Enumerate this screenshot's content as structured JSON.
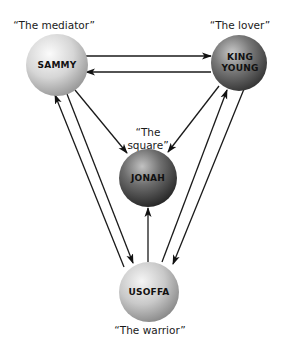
{
  "diagram": {
    "nodes": {
      "sammy": {
        "name": "SAMMY",
        "role": "“The mediator”",
        "cx": 57,
        "cy": 65,
        "r": 31,
        "color_light": "#f4f4f4",
        "color_dark": "#9a9a9a"
      },
      "king_young": {
        "name_line1": "KING",
        "name_line2": "YOUNG",
        "role": "“The lover”",
        "cx": 239,
        "cy": 63,
        "r": 28,
        "color_light": "#bdbdbd",
        "color_dark": "#3d3d3d"
      },
      "jonah": {
        "name": "JONAH",
        "role_line1": "“The",
        "role_line2": "square”",
        "cx": 148,
        "cy": 178,
        "r": 29,
        "color_light": "#b5b5b5",
        "color_dark": "#2e2e2e"
      },
      "usoffa": {
        "name": "USOFFA",
        "role": "“The warrior”",
        "cx": 149,
        "cy": 292,
        "r": 30,
        "color_light": "#f0f0f0",
        "color_dark": "#8c8c8c"
      }
    },
    "edges": [
      {
        "from": "SAMMY",
        "to": "KING YOUNG"
      },
      {
        "from": "KING YOUNG",
        "to": "SAMMY"
      },
      {
        "from": "SAMMY",
        "to": "JONAH"
      },
      {
        "from": "KING YOUNG",
        "to": "JONAH"
      },
      {
        "from": "USOFFA",
        "to": "JONAH"
      },
      {
        "from": "SAMMY",
        "to": "USOFFA"
      },
      {
        "from": "USOFFA",
        "to": "SAMMY"
      },
      {
        "from": "KING YOUNG",
        "to": "USOFFA"
      },
      {
        "from": "USOFFA",
        "to": "KING YOUNG"
      }
    ]
  }
}
